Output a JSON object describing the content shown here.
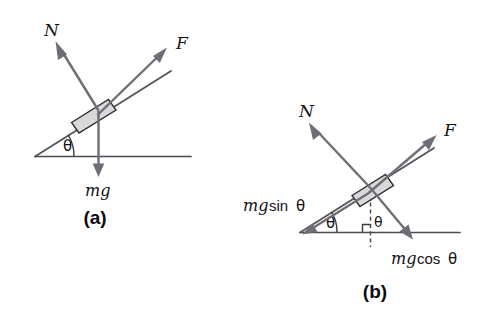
{
  "figure": {
    "background_color": "#ffffff",
    "arrow_color": "#6e6e76",
    "line_color": "#4a4a50",
    "block_fill_color": "#d9d9d9",
    "block_stroke_color": "#2d2d33",
    "text_color": "#121216"
  },
  "panel_a": {
    "caption": "(a)",
    "labels": {
      "normal_force": "N",
      "applied_force": "F",
      "weight": "mg",
      "angle": "θ"
    },
    "elements": {
      "block": "block-on-incline",
      "incline_surface": "incline-line",
      "ground": "horizontal-ground-line",
      "angle_arc": "incline-angle-arc"
    },
    "vectors": [
      {
        "name": "N",
        "label": "N",
        "direction": "perpendicular-to-incline-outward"
      },
      {
        "name": "F",
        "label": "F",
        "direction": "up-the-incline"
      },
      {
        "name": "mg",
        "label": "mg",
        "direction": "vertically-downward"
      }
    ]
  },
  "panel_b": {
    "caption": "(b)",
    "labels": {
      "normal_force": "N",
      "applied_force": "F",
      "weight_parallel_mg": "mg",
      "weight_parallel_fn": "sin",
      "weight_parallel_angle": "θ",
      "weight_perp_mg": "mg",
      "weight_perp_fn": "cos",
      "weight_perp_angle": "θ",
      "angle_base": "θ",
      "angle_interior": "θ"
    },
    "composed_labels": {
      "weight_parallel": "mg sin θ",
      "weight_perpendicular": "mg cos θ"
    },
    "elements": {
      "block": "block-on-incline",
      "incline_surface": "incline-line",
      "ground": "horizontal-ground-line",
      "dashed_vertical": "dashed-vertical-construction-line",
      "right_angle_ground": "right-angle-marker-at-ground",
      "right_angle_incline": "right-angle-marker-at-incline"
    },
    "vectors": [
      {
        "name": "N",
        "label": "N",
        "direction": "perpendicular-to-incline-outward"
      },
      {
        "name": "F",
        "label": "F",
        "direction": "up-the-incline"
      },
      {
        "name": "mg sin theta",
        "label": "mg sin θ",
        "direction": "down-the-incline"
      },
      {
        "name": "mg cos theta",
        "label": "mg cos θ",
        "direction": "perpendicular-into-incline"
      }
    ]
  }
}
